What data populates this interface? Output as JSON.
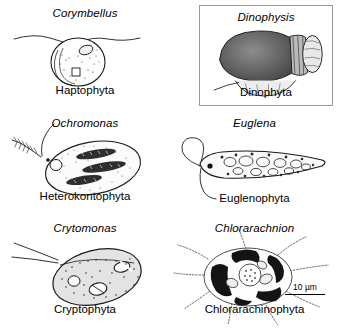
{
  "figure": {
    "background_color": "#ffffff",
    "scale_bar": {
      "label": "10 µm"
    },
    "panels": [
      {
        "genus": "Corymbellus",
        "division": "Haptophyta",
        "organism_icon": "corymbellus-cell-icon",
        "boxed": false
      },
      {
        "genus": "Dinophysis",
        "division": "Dinophyta",
        "organism_icon": "dinophysis-cell-icon",
        "boxed": true
      },
      {
        "genus": "Ochromonas",
        "division": "Heterokontophyta",
        "organism_icon": "ochromonas-cell-icon",
        "boxed": false
      },
      {
        "genus": "Euglena",
        "division": "Euglenophyta",
        "organism_icon": "euglena-cell-icon",
        "boxed": false
      },
      {
        "genus": "Crytomonas",
        "division": "Cryptophyta",
        "organism_icon": "cryptomonas-cell-icon",
        "boxed": false
      },
      {
        "genus": "Chlorarachnion",
        "division": "Chlorarachinophyta",
        "organism_icon": "chlorarachnion-cell-icon",
        "boxed": false
      }
    ]
  }
}
